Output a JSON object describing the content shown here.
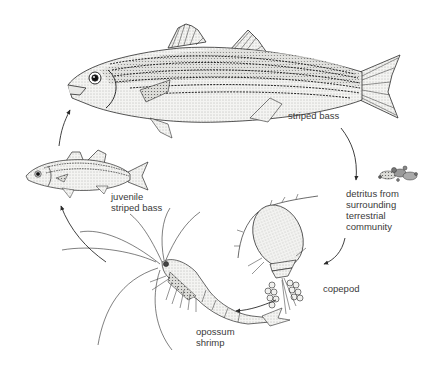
{
  "diagram": {
    "type": "food-chain-cycle",
    "nodes": [
      {
        "id": "striped_bass",
        "label": "striped bass"
      },
      {
        "id": "detritus",
        "label_lines": [
          "detritus from",
          "surrounding",
          "terrestrial",
          "community"
        ]
      },
      {
        "id": "copepod",
        "label": "copepod"
      },
      {
        "id": "opossum_shrimp",
        "label_lines": [
          "opossum",
          "shrimp"
        ]
      },
      {
        "id": "juvenile_striped_bass",
        "label_lines": [
          "juvenile",
          "striped bass"
        ]
      }
    ],
    "edges": [
      {
        "from": "striped_bass",
        "to": "detritus"
      },
      {
        "from": "detritus",
        "to": "copepod"
      },
      {
        "from": "copepod",
        "to": "opossum_shrimp"
      },
      {
        "from": "opossum_shrimp",
        "to": "juvenile_striped_bass"
      },
      {
        "from": "juvenile_striped_bass",
        "to": "striped_bass"
      }
    ],
    "colors": {
      "background": "#ffffff",
      "ink": "#2a2a2a",
      "label": "#3a3a3a"
    }
  }
}
